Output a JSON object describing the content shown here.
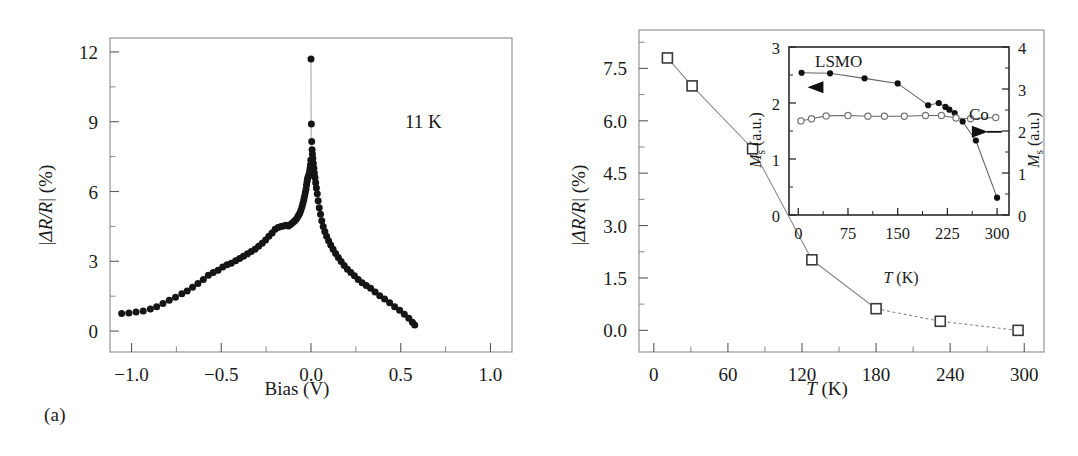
{
  "figure": {
    "panel_a_caption": "(a)",
    "panel_b_caption": "(b)"
  },
  "panel_a": {
    "annotation": "11 K",
    "xlabel_main": "Bias",
    "xlabel_unit": "(V)",
    "ylabel": "|ΔR/R| (%)",
    "xticks": [
      "−1.0",
      "−0.5",
      "0.0",
      "0.5",
      "1.0"
    ],
    "yticks": [
      "0",
      "3",
      "6",
      "9",
      "12"
    ]
  },
  "panel_b": {
    "xlabel_main": "T",
    "xlabel_unit": "(K)",
    "ylabel": "|ΔR/R| (%)",
    "xticks": [
      "0",
      "60",
      "120",
      "180",
      "240",
      "300"
    ],
    "yticks": [
      "0.0",
      "1.5",
      "3.0",
      "4.5",
      "6.0",
      "7.5"
    ]
  },
  "inset": {
    "label_lsmo": "LSMO",
    "label_co": "Co",
    "ylabel_left_m": "M",
    "ylabel_left_sub": "s",
    "ylabel_left_unit": "(a.u.)",
    "ylabel_right_m": "M",
    "ylabel_right_sub": "s",
    "ylabel_right_unit": "(a.u.)",
    "xlabel_main": "T",
    "xlabel_unit": "(K)",
    "xticks": [
      "0",
      "75",
      "150",
      "225",
      "300"
    ],
    "yticks_left": [
      "0",
      "1",
      "2",
      "3"
    ],
    "yticks_right": [
      "0",
      "1",
      "2",
      "3",
      "4"
    ]
  },
  "colors": {
    "marker_filled": "#151515",
    "marker_open_edge": "#3a3a3a",
    "line": "#8a8a8a",
    "frame": "#8c8c8c",
    "inset_frame": "#2a2a2a"
  },
  "chart_data": [
    {
      "type": "scatter",
      "id": "panel-a",
      "title": "",
      "xlabel": "Bias (V)",
      "ylabel": "|ΔR/R| (%)",
      "xlim": [
        -1.12,
        1.12
      ],
      "ylim": [
        -0.9,
        12.6
      ],
      "xticks": [
        -1.0,
        -0.5,
        0.0,
        0.5,
        1.0
      ],
      "yticks": [
        0,
        3,
        6,
        9,
        12
      ],
      "grid": false,
      "legend": null,
      "annotations": [
        {
          "text": "11 K",
          "x": 0.6,
          "y": 9.0
        }
      ],
      "marker": "filled-circle",
      "series": [
        {
          "name": "TMR vs bias at 11 K",
          "x": [
            -1.055,
            -1.015,
            -0.975,
            -0.935,
            -0.895,
            -0.86,
            -0.825,
            -0.79,
            -0.755,
            -0.72,
            -0.69,
            -0.66,
            -0.63,
            -0.6,
            -0.572,
            -0.545,
            -0.518,
            -0.492,
            -0.468,
            -0.444,
            -0.42,
            -0.398,
            -0.376,
            -0.354,
            -0.333,
            -0.312,
            -0.292,
            -0.272,
            -0.253,
            -0.235,
            -0.217,
            -0.2,
            -0.184,
            -0.168,
            -0.153,
            -0.139,
            -0.126,
            -0.114,
            -0.103,
            -0.093,
            -0.084,
            -0.076,
            -0.069,
            -0.062,
            -0.056,
            -0.05,
            -0.045,
            -0.04,
            -0.036,
            -0.032,
            -0.028,
            -0.025,
            -0.022,
            -0.019,
            -0.016,
            -0.013,
            -0.011,
            -0.009,
            -0.007,
            -0.005,
            -0.003,
            -0.001,
            0.0,
            0.002,
            0.004,
            0.006,
            0.008,
            0.01,
            0.013,
            0.016,
            0.019,
            0.022,
            0.026,
            0.03,
            0.035,
            0.04,
            0.046,
            0.053,
            0.06,
            0.068,
            0.077,
            0.087,
            0.098,
            0.11,
            0.123,
            0.137,
            0.152,
            0.168,
            0.185,
            0.203,
            0.222,
            0.242,
            0.263,
            0.285,
            0.308,
            0.332,
            0.357,
            0.383,
            0.41,
            0.438,
            0.466,
            0.494,
            0.52,
            0.545,
            0.565,
            0.578
          ],
          "y": [
            0.75,
            0.78,
            0.82,
            0.86,
            0.95,
            1.05,
            1.18,
            1.32,
            1.45,
            1.6,
            1.72,
            1.88,
            2.05,
            2.22,
            2.4,
            2.52,
            2.62,
            2.75,
            2.85,
            2.92,
            3.02,
            3.12,
            3.22,
            3.32,
            3.42,
            3.52,
            3.65,
            3.78,
            3.92,
            4.08,
            4.22,
            4.38,
            4.45,
            4.5,
            4.52,
            4.55,
            4.52,
            4.58,
            4.66,
            4.72,
            4.8,
            4.88,
            4.98,
            5.08,
            5.2,
            5.35,
            5.5,
            5.65,
            5.8,
            5.95,
            6.1,
            6.28,
            6.42,
            6.55,
            6.62,
            6.68,
            6.72,
            6.78,
            6.88,
            7.0,
            7.15,
            7.35,
            11.7,
            8.9,
            8.15,
            7.8,
            7.6,
            7.42,
            7.2,
            7.0,
            6.8,
            6.6,
            6.38,
            6.15,
            5.9,
            5.6,
            5.3,
            5.02,
            4.74,
            4.5,
            4.28,
            4.08,
            3.88,
            3.7,
            3.52,
            3.34,
            3.16,
            2.99,
            2.82,
            2.66,
            2.52,
            2.38,
            2.22,
            2.08,
            1.96,
            1.84,
            1.68,
            1.52,
            1.38,
            1.22,
            1.05,
            0.9,
            0.72,
            0.55,
            0.38,
            0.26,
            0.18,
            0.14,
            0.12
          ]
        }
      ]
    },
    {
      "type": "line",
      "id": "panel-b",
      "title": "",
      "xlabel": "T (K)",
      "ylabel": "|ΔR/R| (%)",
      "xlim": [
        -12,
        316
      ],
      "ylim": [
        -0.62,
        8.6
      ],
      "xticks": [
        0,
        60,
        120,
        180,
        240,
        300
      ],
      "yticks": [
        0.0,
        1.5,
        3.0,
        4.5,
        6.0,
        7.5
      ],
      "grid": false,
      "legend": null,
      "marker": "open-square",
      "series": [
        {
          "name": "TMR vs temperature",
          "x": [
            11,
            31,
            80,
            128,
            180,
            232,
            295
          ],
          "y": [
            7.8,
            7.0,
            5.2,
            2.02,
            0.62,
            0.26,
            0.0
          ]
        }
      ]
    },
    {
      "type": "line",
      "id": "inset-ms",
      "title": "",
      "xlabel": "T (K)",
      "ylabel": "M_s (a.u.)",
      "xlim": [
        -14,
        318
      ],
      "ylim_left": [
        0,
        3
      ],
      "ylim_right": [
        0,
        4
      ],
      "xticks": [
        0,
        75,
        150,
        225,
        300
      ],
      "yticks_left": [
        0,
        1,
        2,
        3
      ],
      "yticks_right": [
        0,
        1,
        2,
        3,
        4
      ],
      "grid": false,
      "annotations": [
        {
          "text": "LSMO",
          "x": 40,
          "y": 2.82,
          "axis": "left"
        },
        {
          "text": "Co",
          "x": 255,
          "y": 2.25,
          "axis": "left"
        }
      ],
      "series": [
        {
          "name": "LSMO",
          "axis": "left",
          "marker": "filled-circle",
          "x": [
            5,
            48,
            100,
            150,
            196,
            212,
            222,
            228,
            236,
            248,
            268,
            300
          ],
          "y": [
            2.54,
            2.53,
            2.44,
            2.35,
            1.96,
            2.0,
            1.93,
            1.88,
            1.82,
            1.67,
            1.33,
            0.31
          ]
        },
        {
          "name": "Co",
          "axis": "right",
          "marker": "open-circle",
          "x": [
            4,
            20,
            42,
            75,
            105,
            130,
            160,
            192,
            216,
            238,
            260,
            298
          ],
          "y_left_scale": [
            1.68,
            1.72,
            1.77,
            1.78,
            1.76,
            1.76,
            1.76,
            1.78,
            1.78,
            1.73,
            1.72,
            1.74
          ],
          "y": [
            2.24,
            2.29,
            2.36,
            2.37,
            2.35,
            2.35,
            2.35,
            2.37,
            2.37,
            2.31,
            2.29,
            2.32
          ]
        }
      ]
    }
  ]
}
